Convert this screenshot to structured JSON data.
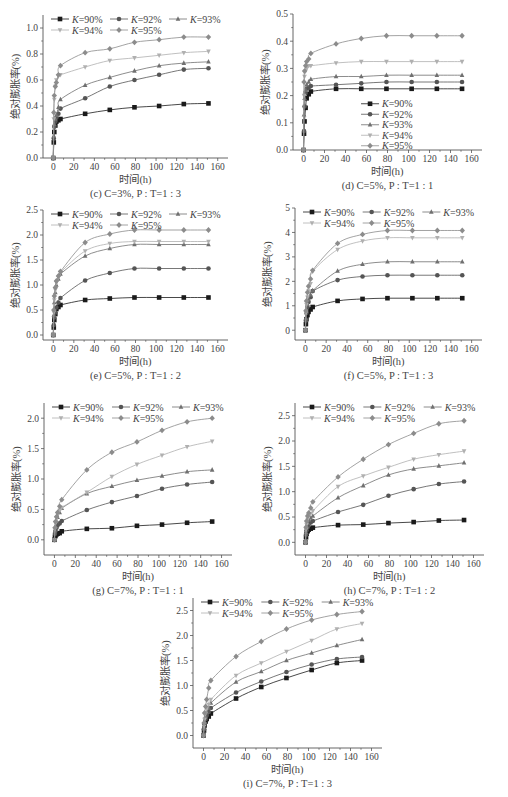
{
  "figure": {
    "xlabel": "时间(h)",
    "ylabel": "绝对膨胀率(%)",
    "legend_labels": [
      "K=90%",
      "K=92%",
      "K=93%",
      "K=94%",
      "K=95%"
    ],
    "series_colors": [
      "#1a1a1a",
      "#555555",
      "#707070",
      "#b0b0b0",
      "#8c8c8c"
    ],
    "series_markers": [
      "square",
      "circle",
      "triangle",
      "triangle-down",
      "diamond"
    ]
  },
  "chart_data": [
    {
      "id": "c",
      "type": "line",
      "caption": "(c) C=3%, P : T=1 : 3",
      "xlabel": "时间(h)",
      "ylabel": "绝对膨胀率(%)",
      "xlim": [
        -10,
        170
      ],
      "ylim": [
        0,
        1.1
      ],
      "xticks": [
        0,
        20,
        40,
        60,
        80,
        100,
        120,
        140,
        160
      ],
      "yticks": [
        0.0,
        0.2,
        0.4,
        0.6,
        0.8,
        1.0
      ],
      "ytick_decimals": 1,
      "legend_position": "top-left",
      "x": [
        0,
        0.5,
        1,
        2,
        3,
        5,
        7,
        31,
        55,
        79,
        103,
        127,
        151
      ],
      "series": [
        {
          "name": "K=90%",
          "values": [
            0.0,
            0.12,
            0.2,
            0.25,
            0.28,
            0.29,
            0.3,
            0.34,
            0.37,
            0.39,
            0.4,
            0.415,
            0.42
          ]
        },
        {
          "name": "K=92%",
          "values": [
            0.0,
            0.15,
            0.24,
            0.28,
            0.31,
            0.34,
            0.38,
            0.46,
            0.55,
            0.6,
            0.64,
            0.68,
            0.69
          ]
        },
        {
          "name": "K=93%",
          "values": [
            0.0,
            0.17,
            0.26,
            0.3,
            0.33,
            0.39,
            0.45,
            0.56,
            0.62,
            0.67,
            0.71,
            0.73,
            0.74
          ]
        },
        {
          "name": "K=94%",
          "values": [
            0.0,
            0.3,
            0.45,
            0.55,
            0.6,
            0.63,
            0.64,
            0.7,
            0.75,
            0.77,
            0.79,
            0.81,
            0.82
          ]
        },
        {
          "name": "K=95%",
          "values": [
            0.0,
            0.35,
            0.48,
            0.55,
            0.58,
            0.64,
            0.71,
            0.81,
            0.84,
            0.89,
            0.91,
            0.93,
            0.93
          ]
        }
      ]
    },
    {
      "id": "d",
      "type": "line",
      "caption": "(d) C=5%, P : T=1 : 1",
      "xlabel": "时间(h)",
      "ylabel": "绝对膨胀率(%)",
      "xlim": [
        -10,
        170
      ],
      "ylim": [
        0,
        0.5
      ],
      "xticks": [
        0,
        20,
        40,
        60,
        80,
        100,
        120,
        140,
        160
      ],
      "yticks": [
        0.0,
        0.1,
        0.2,
        0.3,
        0.4,
        0.5
      ],
      "ytick_decimals": 1,
      "legend_position": "center-right-vertical",
      "x": [
        0,
        0.5,
        1,
        2,
        3,
        5,
        7,
        31,
        55,
        79,
        103,
        127,
        151
      ],
      "series": [
        {
          "name": "K=90%",
          "values": [
            0.0,
            0.06,
            0.105,
            0.155,
            0.19,
            0.205,
            0.215,
            0.225,
            0.225,
            0.225,
            0.225,
            0.225,
            0.225
          ]
        },
        {
          "name": "K=92%",
          "values": [
            0.0,
            0.07,
            0.16,
            0.21,
            0.225,
            0.23,
            0.235,
            0.24,
            0.245,
            0.25,
            0.25,
            0.25,
            0.25
          ]
        },
        {
          "name": "K=93%",
          "values": [
            0.0,
            0.13,
            0.19,
            0.22,
            0.24,
            0.25,
            0.26,
            0.27,
            0.27,
            0.275,
            0.275,
            0.275,
            0.275
          ]
        },
        {
          "name": "K=94%",
          "values": [
            0.0,
            0.2,
            0.27,
            0.29,
            0.3,
            0.31,
            0.31,
            0.32,
            0.325,
            0.325,
            0.325,
            0.325,
            0.325
          ]
        },
        {
          "name": "K=95%",
          "values": [
            0.0,
            0.25,
            0.29,
            0.31,
            0.325,
            0.335,
            0.355,
            0.39,
            0.41,
            0.42,
            0.42,
            0.42,
            0.42
          ]
        }
      ]
    },
    {
      "id": "e",
      "type": "line",
      "caption": "(e) C=5%, P : T=1 : 2",
      "xlabel": "时间(h)",
      "ylabel": "绝对膨胀率(%)",
      "xlim": [
        -10,
        170
      ],
      "ylim": [
        -0.1,
        2.5
      ],
      "xticks": [
        0,
        20,
        40,
        60,
        80,
        100,
        120,
        140,
        160
      ],
      "yticks": [
        0.0,
        0.5,
        1.0,
        1.5,
        2.0,
        2.5
      ],
      "ytick_decimals": 1,
      "legend_position": "top-left",
      "x": [
        0,
        0.5,
        1,
        2,
        3,
        5,
        7,
        31,
        55,
        79,
        103,
        127,
        151
      ],
      "series": [
        {
          "name": "K=90%",
          "values": [
            0.0,
            0.15,
            0.3,
            0.42,
            0.52,
            0.56,
            0.6,
            0.7,
            0.73,
            0.75,
            0.75,
            0.75,
            0.75
          ]
        },
        {
          "name": "K=92%",
          "values": [
            0.0,
            0.2,
            0.35,
            0.45,
            0.55,
            0.65,
            0.74,
            1.09,
            1.24,
            1.33,
            1.33,
            1.33,
            1.33
          ]
        },
        {
          "name": "K=93%",
          "values": [
            0.0,
            0.4,
            0.65,
            0.85,
            1.0,
            1.12,
            1.22,
            1.58,
            1.73,
            1.81,
            1.81,
            1.81,
            1.81
          ]
        },
        {
          "name": "K=94%",
          "values": [
            0.0,
            0.45,
            0.7,
            0.9,
            1.05,
            1.15,
            1.25,
            1.68,
            1.83,
            1.87,
            1.87,
            1.87,
            1.87
          ]
        },
        {
          "name": "K=95%",
          "values": [
            0.0,
            0.5,
            0.78,
            0.95,
            1.08,
            1.18,
            1.27,
            1.85,
            2.02,
            2.1,
            2.1,
            2.1,
            2.1
          ]
        }
      ]
    },
    {
      "id": "f",
      "type": "line",
      "caption": "(f) C=5%, P : T=1 : 3",
      "xlabel": "时间(h)",
      "ylabel": "绝对膨胀率(%)",
      "xlim": [
        -10,
        170
      ],
      "ylim": [
        -0.4,
        5
      ],
      "xticks": [
        0,
        20,
        40,
        60,
        80,
        100,
        120,
        140,
        160
      ],
      "yticks": [
        0,
        1,
        2,
        3,
        4,
        5
      ],
      "ytick_decimals": 0,
      "legend_position": "top-left",
      "x": [
        0,
        0.5,
        1,
        2,
        3,
        5,
        7,
        31,
        55,
        79,
        103,
        127,
        151
      ],
      "series": [
        {
          "name": "K=90%",
          "values": [
            0.0,
            0.25,
            0.45,
            0.62,
            0.75,
            0.85,
            0.95,
            1.2,
            1.28,
            1.31,
            1.31,
            1.31,
            1.31
          ]
        },
        {
          "name": "K=92%",
          "values": [
            0.0,
            0.4,
            0.7,
            0.95,
            1.15,
            1.35,
            1.6,
            2.05,
            2.2,
            2.25,
            2.25,
            2.25,
            2.25
          ]
        },
        {
          "name": "K=93%",
          "values": [
            0.0,
            0.5,
            0.8,
            1.05,
            1.25,
            1.45,
            1.62,
            2.42,
            2.7,
            2.8,
            2.8,
            2.8,
            2.8
          ]
        },
        {
          "name": "K=94%",
          "values": [
            0.0,
            0.7,
            1.05,
            1.35,
            1.6,
            1.9,
            2.4,
            3.3,
            3.65,
            3.78,
            3.78,
            3.78,
            3.78
          ]
        },
        {
          "name": "K=95%",
          "values": [
            0.0,
            0.8,
            1.2,
            1.55,
            1.8,
            2.1,
            2.45,
            3.55,
            3.92,
            4.08,
            4.08,
            4.08,
            4.08
          ]
        }
      ]
    },
    {
      "id": "g",
      "type": "line",
      "caption": "(g) C=7%, P : T=1 : 1",
      "xlabel": "时间(h)",
      "ylabel": "绝对膨胀率(%)",
      "xlim": [
        -10,
        170
      ],
      "ylim": [
        -0.25,
        2.25
      ],
      "xticks": [
        0,
        20,
        40,
        60,
        80,
        100,
        120,
        140,
        160
      ],
      "yticks": [
        0.0,
        0.5,
        1.0,
        1.5,
        2.0
      ],
      "ytick_decimals": 1,
      "legend_position": "top-left",
      "x": [
        0,
        0.5,
        1,
        2,
        3,
        5,
        7,
        31,
        55,
        79,
        103,
        127,
        151
      ],
      "series": [
        {
          "name": "K=90%",
          "values": [
            0.0,
            0.05,
            0.07,
            0.09,
            0.1,
            0.11,
            0.14,
            0.18,
            0.19,
            0.23,
            0.25,
            0.28,
            0.3
          ]
        },
        {
          "name": "K=92%",
          "values": [
            0.0,
            0.1,
            0.15,
            0.2,
            0.24,
            0.27,
            0.31,
            0.49,
            0.62,
            0.72,
            0.84,
            0.91,
            0.95
          ]
        },
        {
          "name": "K=93%",
          "values": [
            0.0,
            0.15,
            0.22,
            0.3,
            0.37,
            0.45,
            0.52,
            0.76,
            0.88,
            0.98,
            1.05,
            1.12,
            1.15
          ]
        },
        {
          "name": "K=94%",
          "values": [
            0.0,
            0.18,
            0.27,
            0.35,
            0.42,
            0.48,
            0.53,
            0.78,
            1.04,
            1.24,
            1.39,
            1.53,
            1.62
          ]
        },
        {
          "name": "K=95%",
          "values": [
            0.0,
            0.2,
            0.3,
            0.38,
            0.45,
            0.55,
            0.66,
            1.15,
            1.44,
            1.61,
            1.8,
            1.94,
            2.0
          ]
        }
      ]
    },
    {
      "id": "h",
      "type": "line",
      "caption": "(h) C=7%, P : T=1 : 2",
      "xlabel": "时间(h)",
      "ylabel": "绝对膨胀率(%)",
      "xlim": [
        -10,
        170
      ],
      "ylim": [
        -0.25,
        2.75
      ],
      "xticks": [
        0,
        20,
        40,
        60,
        80,
        100,
        120,
        140,
        160
      ],
      "yticks": [
        0.0,
        0.5,
        1.0,
        1.5,
        2.0,
        2.5
      ],
      "ytick_decimals": 1,
      "legend_position": "top-left",
      "x": [
        0,
        0.5,
        1,
        2,
        3,
        5,
        7,
        31,
        55,
        79,
        103,
        127,
        151
      ],
      "series": [
        {
          "name": "K=90%",
          "values": [
            0.0,
            0.1,
            0.17,
            0.22,
            0.25,
            0.27,
            0.29,
            0.34,
            0.35,
            0.38,
            0.4,
            0.43,
            0.44
          ]
        },
        {
          "name": "K=92%",
          "values": [
            0.0,
            0.15,
            0.24,
            0.3,
            0.35,
            0.39,
            0.42,
            0.6,
            0.74,
            0.92,
            1.05,
            1.15,
            1.2
          ]
        },
        {
          "name": "K=93%",
          "values": [
            0.0,
            0.2,
            0.3,
            0.38,
            0.44,
            0.48,
            0.52,
            0.88,
            1.12,
            1.33,
            1.45,
            1.51,
            1.57
          ]
        },
        {
          "name": "K=94%",
          "values": [
            0.0,
            0.25,
            0.35,
            0.45,
            0.52,
            0.57,
            0.62,
            1.1,
            1.31,
            1.48,
            1.64,
            1.73,
            1.8
          ]
        },
        {
          "name": "K=95%",
          "values": [
            0.0,
            0.3,
            0.42,
            0.52,
            0.58,
            0.68,
            0.8,
            1.29,
            1.64,
            1.93,
            2.15,
            2.34,
            2.4
          ]
        }
      ]
    },
    {
      "id": "i",
      "type": "line",
      "caption": "(i) C=7%, P : T=1 : 3",
      "xlabel": "时间(h)",
      "ylabel": "绝对膨胀率(%)",
      "xlim": [
        -10,
        170
      ],
      "ylim": [
        -0.25,
        2.75
      ],
      "xticks": [
        0,
        20,
        40,
        60,
        80,
        100,
        120,
        140,
        160
      ],
      "yticks": [
        0.0,
        0.5,
        1.0,
        1.5,
        2.0,
        2.5
      ],
      "ytick_decimals": 1,
      "legend_position": "top-left",
      "x": [
        0,
        0.5,
        1,
        2,
        3,
        5,
        7,
        31,
        55,
        79,
        103,
        127,
        151
      ],
      "series": [
        {
          "name": "K=90%",
          "values": [
            0.0,
            0.1,
            0.2,
            0.28,
            0.33,
            0.38,
            0.44,
            0.74,
            0.97,
            1.15,
            1.31,
            1.45,
            1.5
          ]
        },
        {
          "name": "K=92%",
          "values": [
            0.0,
            0.12,
            0.24,
            0.33,
            0.4,
            0.47,
            0.55,
            0.86,
            1.08,
            1.27,
            1.42,
            1.53,
            1.57
          ]
        },
        {
          "name": "K=93%",
          "values": [
            0.0,
            0.15,
            0.28,
            0.38,
            0.46,
            0.55,
            0.65,
            1.07,
            1.28,
            1.5,
            1.65,
            1.8,
            1.92
          ]
        },
        {
          "name": "K=94%",
          "values": [
            0.0,
            0.18,
            0.32,
            0.44,
            0.53,
            0.62,
            0.72,
            1.2,
            1.45,
            1.68,
            1.9,
            2.13,
            2.24
          ]
        },
        {
          "name": "K=95%",
          "values": [
            0.0,
            0.25,
            0.45,
            0.58,
            0.72,
            0.95,
            1.1,
            1.58,
            1.88,
            2.13,
            2.31,
            2.42,
            2.48
          ]
        }
      ]
    }
  ]
}
